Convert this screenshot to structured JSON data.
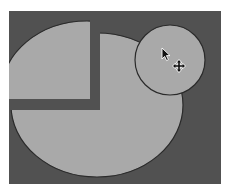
{
  "colors": {
    "page_bg": "#ffffff",
    "canvas_bg": "#515151",
    "shape_fill": "#a9a9a9",
    "shape_stroke": "#2a2a2a",
    "cursor_fill": "#111111",
    "cursor_outline": "#ffffff"
  },
  "canvas": {
    "x": 9,
    "y": 11,
    "width": 212,
    "height": 173
  },
  "shapes": {
    "pie_body": {
      "cx": 97,
      "cy": 105,
      "rx": 86,
      "ry": 72
    },
    "pie_wedge": {
      "offset_x": -10,
      "offset_y": -12,
      "corner_x": 90,
      "corner_y": 99
    },
    "small_circle": {
      "cx": 170,
      "cy": 60,
      "r": 35
    }
  },
  "cursor": {
    "arrow": {
      "x": 162,
      "y": 48
    },
    "move_icon": {
      "cx": 179,
      "cy": 66
    }
  }
}
